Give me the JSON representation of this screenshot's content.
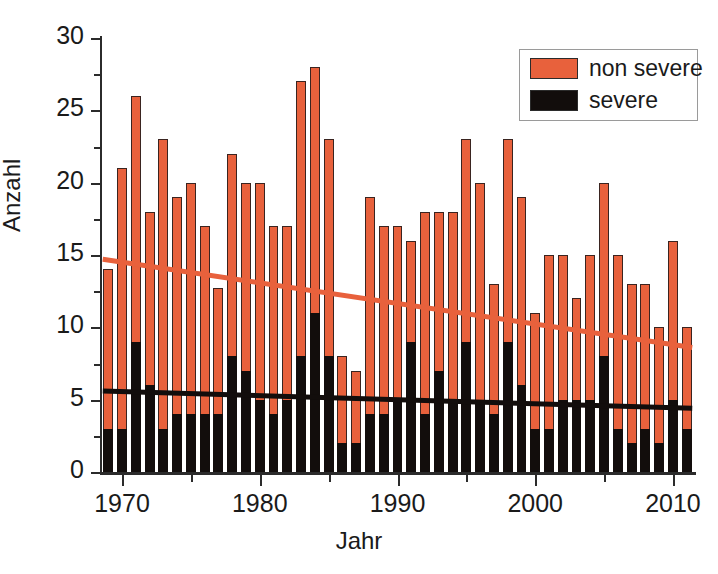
{
  "chart_data": {
    "type": "bar",
    "stacked": true,
    "title": "",
    "xlabel": "Jahr",
    "ylabel": "Anzahl",
    "xlim": [
      1968.4,
      2011.6
    ],
    "ylim": [
      0,
      30
    ],
    "ytick_labels": [
      "0",
      "5",
      "10",
      "15",
      "20",
      "25",
      "30"
    ],
    "ytick_values": [
      0,
      5,
      10,
      15,
      20,
      25,
      30
    ],
    "yminor_step": 2.5,
    "xtick_labels": [
      "1970",
      "1980",
      "1990",
      "2000",
      "2010"
    ],
    "xtick_values": [
      1970,
      1980,
      1990,
      2000,
      2010
    ],
    "xminor_values": [
      1975,
      1985,
      1995,
      2005
    ],
    "grid": false,
    "legend_position": "top-right",
    "legend": [
      {
        "label": "non severe",
        "color": "#e8613c"
      },
      {
        "label": "severe",
        "color": "#120d0c"
      }
    ],
    "categories": [
      1969,
      1970,
      1971,
      1972,
      1973,
      1974,
      1975,
      1976,
      1977,
      1978,
      1979,
      1980,
      1981,
      1982,
      1983,
      1984,
      1985,
      1986,
      1987,
      1988,
      1989,
      1990,
      1991,
      1992,
      1993,
      1994,
      1995,
      1996,
      1997,
      1998,
      1999,
      2000,
      2001,
      2002,
      2003,
      2004,
      2005,
      2006,
      2007,
      2008,
      2009,
      2010,
      2011
    ],
    "series": [
      {
        "name": "severe",
        "color": "#120d0c",
        "values": [
          3,
          3,
          9,
          6,
          3,
          4,
          4,
          4,
          4,
          8,
          7,
          5,
          4,
          5,
          8,
          11,
          8,
          2,
          2,
          4,
          4,
          5,
          9,
          4,
          7,
          5,
          9,
          5,
          4,
          9,
          6,
          3,
          3,
          5,
          5,
          5,
          8,
          3,
          2,
          3,
          2,
          5,
          3
        ]
      },
      {
        "name": "non severe",
        "color": "#e8613c",
        "values": [
          11,
          18,
          17,
          12,
          20,
          15,
          16,
          13,
          8.7,
          14,
          13,
          15,
          13,
          12,
          19,
          17,
          15,
          6,
          5,
          15,
          13,
          12,
          7,
          14,
          11,
          13,
          14,
          15,
          9,
          14,
          13,
          8,
          12,
          10,
          7,
          10,
          12,
          12,
          11,
          10,
          8,
          11,
          7
        ]
      }
    ],
    "totals": [
      14,
      21,
      26,
      18,
      23,
      19,
      20,
      17,
      12.7,
      22,
      20,
      20,
      17,
      17,
      27,
      28,
      23,
      8,
      7,
      19,
      17,
      17,
      16,
      18,
      18,
      18,
      23,
      20,
      13,
      23,
      19,
      11,
      15,
      15,
      12,
      15,
      20,
      15,
      13,
      13,
      10,
      16,
      10
    ],
    "trend_lines": [
      {
        "name": "non severe trend",
        "color": "#e8613c",
        "x_start": 1968.6,
        "y_start": 14.7,
        "x_end": 2011.4,
        "y_end": 8.6
      },
      {
        "name": "severe trend",
        "color": "#120d0c",
        "x_start": 1968.6,
        "y_start": 5.6,
        "x_end": 2011.4,
        "y_end": 4.4
      }
    ]
  }
}
